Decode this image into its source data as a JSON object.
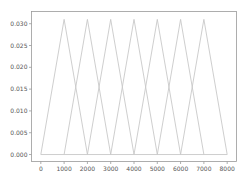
{
  "chart_data": {
    "type": "line",
    "title": "",
    "xlabel": "",
    "ylabel": "",
    "xlim": [
      -400,
      8400
    ],
    "ylim": [
      -0.0016,
      0.0328
    ],
    "grid": false,
    "legend": null,
    "line_color": "#c8c8c8",
    "x_ticks": [
      0,
      1000,
      2000,
      3000,
      4000,
      5000,
      6000,
      7000,
      8000
    ],
    "x_tick_labels": [
      "0",
      "1000",
      "2000",
      "3000",
      "4000",
      "5000",
      "6000",
      "7000",
      "8000"
    ],
    "y_ticks": [
      0.0,
      0.005,
      0.01,
      0.015,
      0.02,
      0.025,
      0.03
    ],
    "y_tick_labels": [
      "0.000",
      "0.005",
      "0.010",
      "0.015",
      "0.020",
      "0.025",
      "0.030"
    ],
    "series": [
      {
        "name": "triangle-1",
        "x": [
          0,
          1000,
          2000
        ],
        "y": [
          0,
          0.031,
          0
        ]
      },
      {
        "name": "triangle-2",
        "x": [
          1000,
          2000,
          3000
        ],
        "y": [
          0,
          0.031,
          0
        ]
      },
      {
        "name": "triangle-3",
        "x": [
          2000,
          3000,
          4000
        ],
        "y": [
          0,
          0.031,
          0
        ]
      },
      {
        "name": "triangle-4",
        "x": [
          3000,
          4000,
          5000
        ],
        "y": [
          0,
          0.031,
          0
        ]
      },
      {
        "name": "triangle-5",
        "x": [
          4000,
          5000,
          6000
        ],
        "y": [
          0,
          0.031,
          0
        ]
      },
      {
        "name": "triangle-6",
        "x": [
          5000,
          6000,
          7000
        ],
        "y": [
          0,
          0.031,
          0
        ]
      },
      {
        "name": "triangle-7",
        "x": [
          6000,
          7000,
          8000
        ],
        "y": [
          0,
          0.031,
          0
        ]
      },
      {
        "name": "baseline",
        "x": [
          0,
          8000
        ],
        "y": [
          0,
          0
        ]
      }
    ]
  }
}
